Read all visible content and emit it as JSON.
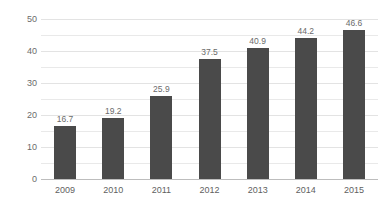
{
  "chart_data": {
    "type": "bar",
    "title": "",
    "xlabel": "",
    "ylabel": "",
    "categories": [
      "2009",
      "2010",
      "2011",
      "2012",
      "2013",
      "2014",
      "2015"
    ],
    "values": [
      16.7,
      19.2,
      25.9,
      37.5,
      40.9,
      44.2,
      46.6
    ],
    "value_labels": [
      "16.7",
      "19.2",
      "25.9",
      "37.5",
      "40.9",
      "44.2",
      "46.6"
    ],
    "ylim": [
      0,
      50
    ],
    "ytick_labels": [
      "0",
      "10",
      "20",
      "30",
      "40",
      "50"
    ],
    "ytick_values": [
      0,
      10,
      20,
      30,
      40,
      50
    ],
    "gridline_values": [
      5,
      10,
      15,
      20,
      25,
      30,
      35,
      40,
      45,
      50
    ],
    "grid": true,
    "legend": "none",
    "bar_color": "#4a4a4a",
    "grid_color": "#e9e9e9",
    "axis_color": "#bdbdbd",
    "label_color": "#6b6b6b",
    "background_color": "#ffffff"
  }
}
